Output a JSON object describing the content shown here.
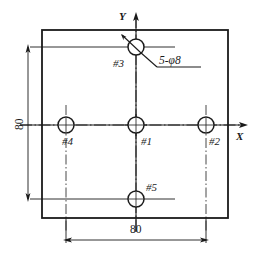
{
  "drawing": {
    "title": "Hole pattern plate drawing",
    "line_color": "#1a1a1a",
    "background_color": "#ffffff",
    "axes": {
      "x_label": "X",
      "y_label": "Y",
      "origin_hole": "#1"
    },
    "callout": {
      "text": "5-φ8",
      "quantity": 5,
      "diameter": 8,
      "points_to": "#3"
    },
    "dimensions": [
      {
        "name": "vertical-80",
        "value": "80",
        "orientation": "vertical",
        "from": "#3",
        "to": "#5"
      },
      {
        "name": "horizontal-80",
        "value": "80",
        "orientation": "horizontal",
        "from": "#4",
        "to": "#2"
      }
    ],
    "holes": [
      {
        "id": "#1",
        "label": "#1",
        "cx": 136,
        "cy": 125,
        "r": 8,
        "label_dx": 8,
        "label_dy": 10
      },
      {
        "id": "#2",
        "label": "#2",
        "cx": 206,
        "cy": 125,
        "r": 8,
        "label_dx": 8,
        "label_dy": 10
      },
      {
        "id": "#3",
        "label": "#3",
        "cx": 136,
        "cy": 47,
        "r": 8,
        "label_dx": -26,
        "label_dy": 10
      },
      {
        "id": "#4",
        "label": "#4",
        "cx": 66,
        "cy": 125,
        "r": 8,
        "label_dx": 0,
        "label_dy": 10
      },
      {
        "id": "#5",
        "label": "#5",
        "cx": 136,
        "cy": 199,
        "r": 8,
        "label_dx": 10,
        "label_dy": -10
      }
    ],
    "plate": {
      "x": 42,
      "y": 30,
      "width": 186,
      "height": 188
    }
  }
}
